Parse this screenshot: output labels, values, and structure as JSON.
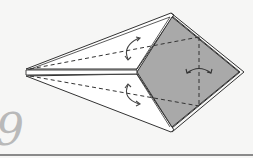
{
  "step": {
    "number": "9",
    "color": "#b9b9b9"
  },
  "colors": {
    "background": "#f6f6f5",
    "paper_white": "#ffffff",
    "paper_grey": "#a9a9a9",
    "line": "#333333",
    "rule": "#8a8a8a"
  },
  "diagram": {
    "arrows": [
      {
        "name": "fold-arrow-top-flap",
        "type": "curved-double-arrow"
      },
      {
        "name": "fold-arrow-bottom-flap",
        "type": "curved-double-arrow"
      },
      {
        "name": "flip-arrow-right",
        "type": "horizontal-curved-double-arrow"
      }
    ],
    "fold_lines": [
      {
        "name": "valley-line-top",
        "style": "dashed"
      },
      {
        "name": "valley-line-bottom",
        "style": "dashed"
      },
      {
        "name": "valley-line-vertical",
        "style": "dashed"
      }
    ]
  }
}
